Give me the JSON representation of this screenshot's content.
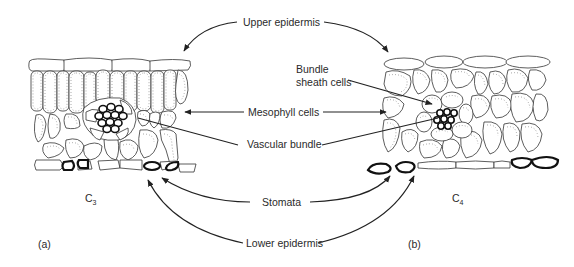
{
  "figure": {
    "panel_a": {
      "label": "(a)",
      "pathway": "C",
      "pathway_sub": "3"
    },
    "panel_b": {
      "label": "(b)",
      "pathway": "C",
      "pathway_sub": "4"
    }
  },
  "labels": {
    "upper_epidermis": "Upper epidermis",
    "bundle_sheath_line1": "Bundle",
    "bundle_sheath_line2": "sheath cells",
    "mesophyll": "Mesophyll cells",
    "vascular_bundle": "Vascular bundle",
    "stomata": "Stomata",
    "lower_epidermis": "Lower epidermis"
  },
  "colors": {
    "line": "#222222",
    "background": "#ffffff",
    "text": "#2a2a2a"
  }
}
